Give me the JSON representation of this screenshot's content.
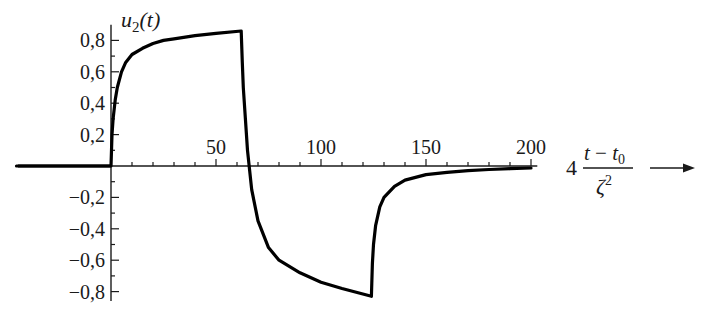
{
  "chart_data": {
    "type": "line",
    "title": "",
    "xlabel": "4 (t − t0) / ζ²",
    "ylabel": "u2(t)",
    "xlim": [
      -45,
      240
    ],
    "ylim": [
      -0.85,
      0.9
    ],
    "grid": false,
    "legend": null,
    "x_ticks": [
      50,
      100,
      150,
      200
    ],
    "x_tick_labels": [
      "50",
      "100",
      "150",
      "200"
    ],
    "x_minor_tick_step": 10,
    "y_ticks": [
      0.8,
      0.6,
      0.4,
      0.2,
      -0.2,
      -0.4,
      -0.6,
      -0.8
    ],
    "y_tick_labels": [
      "0,8",
      "0,6",
      "0,4",
      "0,2",
      "−0,2",
      "−0,4",
      "−0,6",
      "−0,8"
    ],
    "y_minor_tick_step": 0.1,
    "series": [
      {
        "name": "u2(t)",
        "color": "#000000",
        "x": [
          -45,
          0,
          0.5,
          1,
          2,
          3,
          5,
          7,
          10,
          15,
          20,
          25,
          30,
          40,
          50,
          62,
          62.5,
          63,
          64,
          65,
          67,
          70,
          75,
          80,
          90,
          100,
          110,
          124,
          124.5,
          125,
          126,
          128,
          130,
          135,
          140,
          150,
          160,
          170,
          180,
          190,
          200
        ],
        "y": [
          0,
          0,
          0.2,
          0.3,
          0.42,
          0.5,
          0.6,
          0.66,
          0.71,
          0.75,
          0.78,
          0.8,
          0.81,
          0.83,
          0.845,
          0.86,
          0.66,
          0.5,
          0.3,
          0.1,
          -0.15,
          -0.35,
          -0.52,
          -0.6,
          -0.68,
          -0.74,
          -0.78,
          -0.83,
          -0.62,
          -0.5,
          -0.38,
          -0.26,
          -0.2,
          -0.13,
          -0.09,
          -0.055,
          -0.04,
          -0.03,
          -0.022,
          -0.017,
          -0.013
        ]
      }
    ]
  },
  "labels": {
    "y_axis_title_main": "u",
    "y_axis_title_sub": "2",
    "y_axis_title_arg": "(t)",
    "x_axis_coef": "4",
    "x_axis_num_t": "t",
    "x_axis_num_minus": " − ",
    "x_axis_num_t0": "t",
    "x_axis_num_t0_sub": "0",
    "x_axis_den": "ζ",
    "x_axis_den_sup": "2",
    "arrow": "→"
  },
  "style": {
    "line_color": "#000000",
    "axis_color": "#1a1a1a",
    "background": "#ffffff"
  }
}
